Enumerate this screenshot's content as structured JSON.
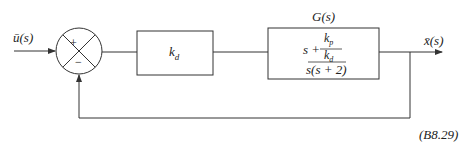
{
  "diagram": {
    "type": "block-diagram",
    "input": {
      "label": "ū(s)"
    },
    "summing_junction": {
      "signs": {
        "top": "+",
        "bottom": "−"
      }
    },
    "blocks": [
      {
        "id": "controller",
        "label": "k_d",
        "text_main": "k",
        "text_sub": "d"
      },
      {
        "id": "plant",
        "title": "G(s)",
        "numerator": {
          "lead": "s +",
          "frac_top_main": "k",
          "frac_top_sub": "p",
          "frac_bottom_main": "k",
          "frac_bottom_sub": "d"
        },
        "denominator": "s(s + 2)"
      }
    ],
    "output": {
      "label": "x̄(s)"
    },
    "feedback": {
      "type": "unity",
      "sign": "negative"
    },
    "equation_number": "(B8.29)"
  },
  "colors": {
    "line": "#333333",
    "text": "#222222",
    "background": "#ffffff"
  }
}
